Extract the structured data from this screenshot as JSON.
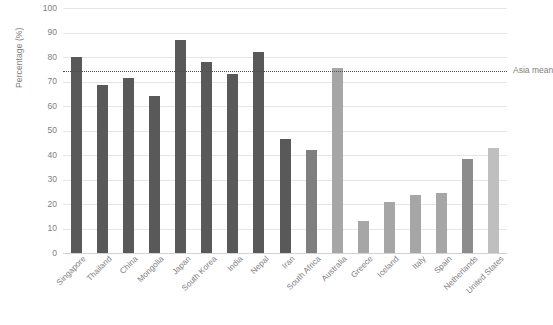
{
  "chart_data": {
    "type": "bar",
    "title": "",
    "subtitle": "",
    "xlabel": "",
    "ylabel": "Percentage (%)",
    "ylim": [
      0,
      100
    ],
    "ytick_step": 10,
    "yticks": [
      "100",
      "90",
      "80",
      "70",
      "60",
      "50",
      "40",
      "30",
      "20",
      "10",
      "0"
    ],
    "grid": true,
    "legend": "none",
    "categories": [
      "Singapore",
      "Thailand",
      "China",
      "Mongolia",
      "Japan",
      "South Korea",
      "India",
      "Nepal",
      "Iran",
      "South Africa",
      "Australia",
      "Greece",
      "Iceland",
      "Italy",
      "Spain",
      "Netherlands",
      "United States"
    ],
    "values": [
      80,
      68.5,
      71.5,
      64,
      87,
      78,
      73,
      82,
      46.5,
      42,
      75.5,
      13,
      21,
      23.5,
      24.5,
      38.5,
      43
    ],
    "bar_colors": [
      "#595959",
      "#595959",
      "#595959",
      "#595959",
      "#595959",
      "#595959",
      "#595959",
      "#595959",
      "#595959",
      "#7f7f7f",
      "#a6a6a6",
      "#a6a6a6",
      "#a6a6a6",
      "#a6a6a6",
      "#a6a6a6",
      "#8c8c8c",
      "#bfbfbf"
    ],
    "annotations": [
      {
        "name": "asia-mean",
        "label": "Asia mean",
        "value": 74.2,
        "style": "dotted",
        "color": "#4d4d4d"
      }
    ],
    "colors": {
      "grid": "#e6e6e6",
      "axis": "#d2d2d2",
      "text": "#808080",
      "dark_bar": "#595959",
      "light_bar": "#a6a6a6",
      "background": "#ffffff"
    }
  }
}
